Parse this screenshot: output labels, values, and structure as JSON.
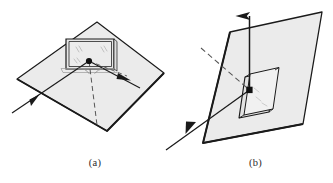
{
  "figure": {
    "background_color": "#ffffff",
    "ink_color": "#1a1a1a",
    "plane_fill_color": "#ebebeb",
    "plane_fill_color_dark": "#e0e0e0",
    "panels": [
      {
        "id": "a",
        "caption": "(a)",
        "description": "Horizontal plane with upright rectangular screen, incident ray, reflected ray and dashed normal",
        "elements": {
          "ground_plane": "parallelogram",
          "upright_screen": "rectangle",
          "vertex_point": "filled-dot",
          "incident_ray": "solid-arrow-from-lower-left",
          "reflected_ray": "solid-arrow-to-lower-right",
          "normal_line": "dashed-line-downward",
          "angle_arcs": 2
        }
      },
      {
        "id": "b",
        "caption": "(b)",
        "description": "Tilted plane with rectangular recessed aperture, vertical normal arrow, dashed incident line and solid ray to lower left",
        "elements": {
          "tilted_plane": "parallelogram",
          "aperture": "recessed-rectangle",
          "vertex_point": "filled-dot",
          "normal_arrow": "solid-arrow-upward",
          "dashed_ray": "dashed-line-from-upper-left",
          "outgoing_ray": "solid-arrow-to-lower-left"
        }
      }
    ]
  }
}
